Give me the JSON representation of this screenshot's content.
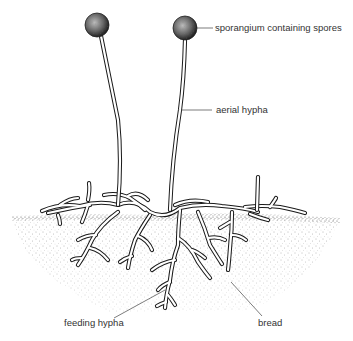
{
  "diagram": {
    "labels": {
      "sporangium": "sporangium containing spores",
      "aerial_hypha": "aerial hypha",
      "feeding_hypha": "feeding hypha",
      "bread": "bread"
    },
    "colors": {
      "ink": "#1a1a1a",
      "label_text": "#333333",
      "background": "#ffffff",
      "stipple": "#555555"
    }
  }
}
